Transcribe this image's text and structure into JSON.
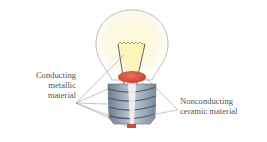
{
  "diagram": {
    "labels": {
      "left": [
        "Conducting",
        "metallic",
        "material"
      ],
      "right": [
        "Nonconducting",
        "ceramic material"
      ]
    },
    "colors": {
      "glass_outline": "#b8b8b8",
      "glow": "#fbf6c8",
      "ceramic_insulator": "#d9523f",
      "metal_base": "#8f9cae",
      "leader_lines": "#8a8a8a",
      "text": "#555555"
    }
  }
}
